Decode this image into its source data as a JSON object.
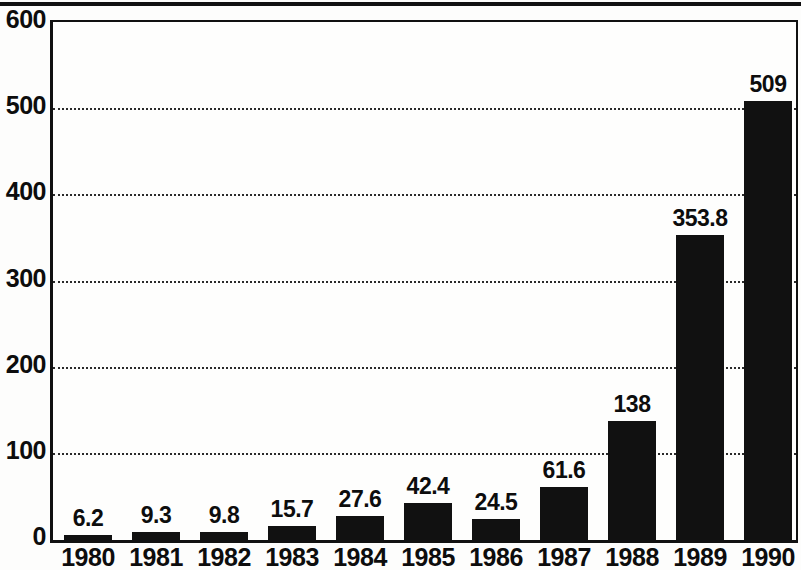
{
  "chart_data": {
    "type": "bar",
    "title": "",
    "subtitle": "",
    "xlabel": "",
    "ylabel": "",
    "categories": [
      "1980",
      "1981",
      "1982",
      "1983",
      "1984",
      "1985",
      "1986",
      "1987",
      "1988",
      "1989",
      "1990"
    ],
    "values": [
      6.2,
      9.3,
      9.8,
      15.7,
      27.6,
      42.4,
      24.5,
      61.6,
      138,
      353.8,
      509
    ],
    "value_labels": [
      "6.2",
      "9.3",
      "9.8",
      "15.7",
      "27.6",
      "42.4",
      "24.5",
      "61.6",
      "138",
      "353.8",
      "509"
    ],
    "ylim": [
      0,
      600
    ],
    "y_ticks": [
      0,
      100,
      200,
      300,
      400,
      500,
      600
    ],
    "y_tick_labels": [
      "0",
      "100",
      "200",
      "300",
      "400",
      "500",
      "600"
    ],
    "gridlines": [
      100,
      200,
      300,
      400,
      500
    ],
    "grid": true,
    "legend": null,
    "legend_position": "none",
    "bar_color": "#111111",
    "background_color": "#fefefd",
    "axis_color": "#111111",
    "gridline_color": "#2a2a2a"
  }
}
